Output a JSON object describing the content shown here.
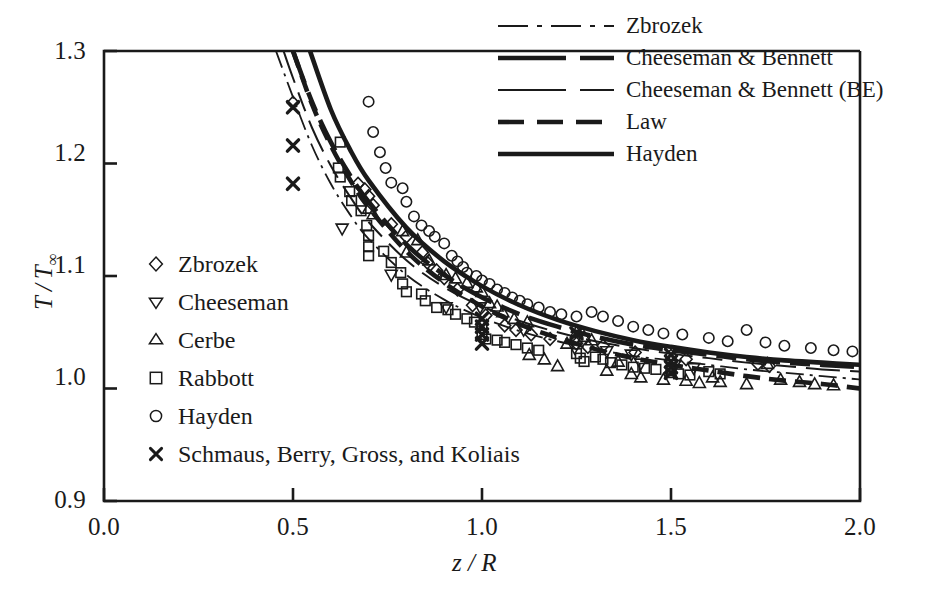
{
  "chart_data": {
    "type": "scatter",
    "title": "",
    "xlabel": "z / R",
    "ylabel": "T / T∞",
    "xlim": [
      0.0,
      2.0
    ],
    "ylim": [
      0.9,
      1.3
    ],
    "xticks": [
      "0.0",
      "0.5",
      "1.0",
      "1.5",
      "2.0"
    ],
    "xtick_values": [
      0.0,
      0.5,
      1.0,
      1.5,
      2.0
    ],
    "yticks": [
      "0.9",
      "1.0",
      "1.1",
      "1.2",
      "1.3"
    ],
    "ytick_values": [
      0.9,
      1.0,
      1.1,
      1.2,
      1.3
    ],
    "grid": false,
    "legend_position": "top-right (curves), middle-left (markers)",
    "curve_legend": [
      {
        "name": "Zbrozek",
        "style": "dash-dot",
        "width": 1.6
      },
      {
        "name": "Cheeseman & Bennett",
        "style": "long-dash",
        "width": 4.2
      },
      {
        "name": "Cheeseman & Bennett (BE)",
        "style": "long-dash",
        "width": 1.8
      },
      {
        "name": "Law",
        "style": "medium-dash",
        "width": 4.2
      },
      {
        "name": "Hayden",
        "style": "solid",
        "width": 4.2
      }
    ],
    "marker_legend": [
      {
        "name": "Zbrozek",
        "marker": "diamond"
      },
      {
        "name": "Cheeseman",
        "marker": "triangle-down"
      },
      {
        "name": "Cerbe",
        "marker": "triangle-up"
      },
      {
        "name": "Rabbott",
        "marker": "square"
      },
      {
        "name": "Hayden",
        "marker": "circle"
      },
      {
        "name": "Schmaus, Berry, Gross, and Koliais",
        "marker": "cross-x"
      }
    ],
    "series": [
      {
        "name": "Zbrozek",
        "kind": "curve",
        "style": "dash-dot",
        "x": [
          0.455,
          0.5,
          0.55,
          0.6,
          0.65,
          0.7,
          0.8,
          0.9,
          1.0,
          1.1,
          1.2,
          1.3,
          1.4,
          1.5,
          1.6,
          1.7,
          1.8,
          1.9,
          2.0
        ],
        "y": [
          1.3,
          1.259,
          1.216,
          1.182,
          1.155,
          1.133,
          1.101,
          1.079,
          1.063,
          1.051,
          1.042,
          1.035,
          1.029,
          1.025,
          1.021,
          1.017,
          1.014,
          1.011,
          1.008
        ]
      },
      {
        "name": "Cheeseman & Bennett",
        "kind": "curve",
        "style": "long-dash",
        "x": [
          0.5,
          0.55,
          0.6,
          0.65,
          0.7,
          0.8,
          0.9,
          1.0,
          1.1,
          1.2,
          1.3,
          1.4,
          1.5,
          1.6,
          1.7,
          1.8,
          1.9,
          2.0
        ],
        "y": [
          1.3,
          1.255,
          1.219,
          1.19,
          1.166,
          1.128,
          1.101,
          1.081,
          1.066,
          1.055,
          1.046,
          1.039,
          1.034,
          1.03,
          1.026,
          1.023,
          1.021,
          1.019
        ]
      },
      {
        "name": "Cheeseman & Bennett (BE)",
        "kind": "curve",
        "style": "long-dash",
        "x": [
          0.475,
          0.5,
          0.55,
          0.6,
          0.65,
          0.7,
          0.8,
          0.9,
          1.0,
          1.1,
          1.2,
          1.3,
          1.4,
          1.5,
          1.6,
          1.7,
          1.8,
          1.9,
          2.0
        ],
        "y": [
          1.3,
          1.276,
          1.232,
          1.198,
          1.171,
          1.148,
          1.114,
          1.09,
          1.073,
          1.06,
          1.05,
          1.042,
          1.036,
          1.031,
          1.027,
          1.023,
          1.02,
          1.017,
          1.015
        ]
      },
      {
        "name": "Law",
        "kind": "curve",
        "style": "medium-dash",
        "x": [
          0.5,
          0.55,
          0.6,
          0.65,
          0.7,
          0.8,
          0.9,
          1.0,
          1.1,
          1.2,
          1.3,
          1.4,
          1.5,
          1.6,
          1.7,
          1.8,
          1.9,
          2.0
        ],
        "y": [
          1.3,
          1.253,
          1.216,
          1.186,
          1.161,
          1.122,
          1.094,
          1.073,
          1.057,
          1.045,
          1.035,
          1.027,
          1.021,
          1.016,
          1.011,
          1.007,
          1.004,
          1.0
        ]
      },
      {
        "name": "Hayden",
        "kind": "curve",
        "style": "solid",
        "x": [
          0.545,
          0.6,
          0.65,
          0.7,
          0.8,
          0.9,
          1.0,
          1.1,
          1.2,
          1.3,
          1.4,
          1.5,
          1.6,
          1.7,
          1.8,
          1.9,
          2.0
        ],
        "y": [
          1.3,
          1.248,
          1.213,
          1.185,
          1.143,
          1.113,
          1.091,
          1.074,
          1.061,
          1.051,
          1.043,
          1.037,
          1.032,
          1.028,
          1.025,
          1.023,
          1.021
        ]
      },
      {
        "name": "Zbrozek",
        "kind": "points",
        "marker": "diamond",
        "points": [
          [
            0.5,
            1.254
          ],
          [
            0.672,
            1.182
          ],
          [
            0.69,
            1.177
          ],
          [
            0.7,
            1.171
          ],
          [
            0.712,
            1.163
          ],
          [
            0.76,
            1.146
          ],
          [
            0.8,
            1.135
          ],
          [
            0.842,
            1.121
          ],
          [
            0.855,
            1.112
          ],
          [
            0.88,
            1.105
          ],
          [
            0.9,
            1.098
          ],
          [
            0.935,
            1.088
          ],
          [
            0.975,
            1.074
          ],
          [
            1.01,
            1.065
          ],
          [
            1.06,
            1.056
          ],
          [
            1.09,
            1.052
          ],
          [
            1.13,
            1.048
          ],
          [
            1.18,
            1.044
          ],
          [
            1.25,
            1.04
          ],
          [
            1.28,
            1.037
          ],
          [
            1.32,
            1.038
          ],
          [
            1.405,
            1.032
          ],
          [
            1.5,
            1.029
          ],
          [
            1.54,
            1.026
          ],
          [
            1.73,
            1.022
          ],
          [
            1.76,
            1.02
          ]
        ]
      },
      {
        "name": "Cheeseman",
        "kind": "points",
        "marker": "triangle-down",
        "points": [
          [
            0.63,
            1.142
          ],
          [
            0.76,
            1.101
          ],
          [
            0.905,
            1.072
          ],
          [
            0.995,
            1.072
          ],
          [
            1.11,
            1.052
          ],
          [
            1.245,
            1.036
          ],
          [
            1.33,
            1.033
          ],
          [
            1.395,
            1.03
          ],
          [
            1.42,
            1.022
          ],
          [
            1.51,
            1.021
          ],
          [
            1.56,
            1.018
          ]
        ]
      },
      {
        "name": "Cerbe",
        "kind": "points",
        "marker": "triangle-up",
        "points": [
          [
            0.7,
            1.16
          ],
          [
            0.712,
            1.155
          ],
          [
            0.79,
            1.14
          ],
          [
            0.8,
            1.121
          ],
          [
            0.83,
            1.132
          ],
          [
            0.86,
            1.114
          ],
          [
            0.905,
            1.101
          ],
          [
            0.93,
            1.098
          ],
          [
            0.96,
            1.094
          ],
          [
            0.985,
            1.09
          ],
          [
            1.0,
            1.086
          ],
          [
            1.02,
            1.076
          ],
          [
            1.04,
            1.073
          ],
          [
            1.055,
            1.068
          ],
          [
            1.085,
            1.062
          ],
          [
            1.12,
            1.059
          ],
          [
            1.125,
            1.03
          ],
          [
            1.165,
            1.026
          ],
          [
            1.2,
            1.02
          ],
          [
            1.225,
            1.04
          ],
          [
            1.25,
            1.05
          ],
          [
            1.27,
            1.046
          ],
          [
            1.29,
            1.043
          ],
          [
            1.33,
            1.016
          ],
          [
            1.36,
            1.024
          ],
          [
            1.395,
            1.013
          ],
          [
            1.42,
            1.01
          ],
          [
            1.48,
            1.008
          ],
          [
            1.5,
            1.014
          ],
          [
            1.54,
            1.007
          ],
          [
            1.575,
            1.005
          ],
          [
            1.61,
            1.01
          ],
          [
            1.63,
            1.006
          ],
          [
            1.7,
            1.004
          ],
          [
            1.755,
            1.022
          ],
          [
            1.79,
            1.008
          ],
          [
            1.84,
            1.006
          ],
          [
            1.88,
            1.004
          ],
          [
            1.93,
            1.003
          ]
        ]
      },
      {
        "name": "Rabbott",
        "kind": "points",
        "marker": "square",
        "points": [
          [
            0.625,
            1.219
          ],
          [
            0.62,
            1.196
          ],
          [
            0.625,
            1.188
          ],
          [
            0.65,
            1.175
          ],
          [
            0.655,
            1.167
          ],
          [
            0.68,
            1.158
          ],
          [
            0.695,
            1.145
          ],
          [
            0.7,
            1.136
          ],
          [
            0.7,
            1.126
          ],
          [
            0.7,
            1.118
          ],
          [
            0.74,
            1.122
          ],
          [
            0.76,
            1.112
          ],
          [
            0.785,
            1.103
          ],
          [
            0.79,
            1.093
          ],
          [
            0.8,
            1.086
          ],
          [
            0.84,
            1.084
          ],
          [
            0.85,
            1.078
          ],
          [
            0.88,
            1.072
          ],
          [
            0.91,
            1.07
          ],
          [
            0.93,
            1.066
          ],
          [
            0.96,
            1.062
          ],
          [
            0.98,
            1.059
          ],
          [
            1.0,
            1.056
          ],
          [
            1.0,
            1.048
          ],
          [
            1.01,
            1.044
          ],
          [
            1.04,
            1.043
          ],
          [
            1.06,
            1.041
          ],
          [
            1.09,
            1.039
          ],
          [
            1.12,
            1.036
          ],
          [
            1.15,
            1.034
          ],
          [
            1.25,
            1.031
          ],
          [
            1.26,
            1.027
          ],
          [
            1.27,
            1.024
          ],
          [
            1.3,
            1.028
          ],
          [
            1.32,
            1.026
          ],
          [
            1.34,
            1.023
          ],
          [
            1.37,
            1.021
          ],
          [
            1.4,
            1.019
          ],
          [
            1.43,
            1.018
          ],
          [
            1.46,
            1.017
          ],
          [
            1.5,
            1.016
          ],
          [
            1.52,
            1.013
          ],
          [
            1.55,
            1.012
          ],
          [
            1.6,
            1.015
          ],
          [
            1.63,
            1.013
          ]
        ]
      },
      {
        "name": "Hayden",
        "kind": "points",
        "marker": "circle",
        "points": [
          [
            0.7,
            1.255
          ],
          [
            0.712,
            1.228
          ],
          [
            0.73,
            1.21
          ],
          [
            0.745,
            1.196
          ],
          [
            0.76,
            1.183
          ],
          [
            0.79,
            1.178
          ],
          [
            0.8,
            1.166
          ],
          [
            0.82,
            1.153
          ],
          [
            0.84,
            1.145
          ],
          [
            0.86,
            1.14
          ],
          [
            0.875,
            1.135
          ],
          [
            0.9,
            1.129
          ],
          [
            0.92,
            1.118
          ],
          [
            0.935,
            1.113
          ],
          [
            0.95,
            1.108
          ],
          [
            0.96,
            1.103
          ],
          [
            0.985,
            1.1
          ],
          [
            1.0,
            1.096
          ],
          [
            1.02,
            1.093
          ],
          [
            1.04,
            1.088
          ],
          [
            1.06,
            1.085
          ],
          [
            1.08,
            1.081
          ],
          [
            1.1,
            1.078
          ],
          [
            1.12,
            1.075
          ],
          [
            1.15,
            1.072
          ],
          [
            1.18,
            1.068
          ],
          [
            1.21,
            1.066
          ],
          [
            1.25,
            1.064
          ],
          [
            1.29,
            1.068
          ],
          [
            1.32,
            1.064
          ],
          [
            1.36,
            1.06
          ],
          [
            1.4,
            1.055
          ],
          [
            1.44,
            1.052
          ],
          [
            1.48,
            1.049
          ],
          [
            1.53,
            1.048
          ],
          [
            1.6,
            1.045
          ],
          [
            1.65,
            1.042
          ],
          [
            1.7,
            1.052
          ],
          [
            1.75,
            1.041
          ],
          [
            1.8,
            1.038
          ],
          [
            1.87,
            1.036
          ],
          [
            1.93,
            1.034
          ],
          [
            1.98,
            1.033
          ]
        ]
      },
      {
        "name": "Schmaus, Berry, Gross, and Koliais",
        "kind": "points",
        "marker": "cross-x",
        "points": [
          [
            0.5,
            1.25
          ],
          [
            0.5,
            1.216
          ],
          [
            0.5,
            1.182
          ],
          [
            1.0,
            1.062
          ],
          [
            1.0,
            1.055
          ],
          [
            1.0,
            1.048
          ],
          [
            1.0,
            1.04
          ],
          [
            1.25,
            1.049
          ],
          [
            1.5,
            1.03
          ],
          [
            1.5,
            1.024
          ],
          [
            1.5,
            1.019
          ],
          [
            1.5,
            1.014
          ]
        ]
      }
    ]
  },
  "axes": {
    "x_title": "z / R",
    "y_title_num": "T",
    "y_title_den": "T",
    "y_title_sub": "∞"
  },
  "curve_legend_labels": [
    "Zbrozek",
    "Cheeseman & Bennett",
    "Cheeseman & Bennett (BE)",
    "Law",
    "Hayden"
  ],
  "marker_legend_labels": [
    "Zbrozek",
    "Cheeseman",
    "Cerbe",
    "Rabbott",
    "Hayden",
    "Schmaus, Berry, Gross, and Koliais"
  ],
  "colors": {
    "ink": "#1a1a1a",
    "background": "#ffffff"
  }
}
